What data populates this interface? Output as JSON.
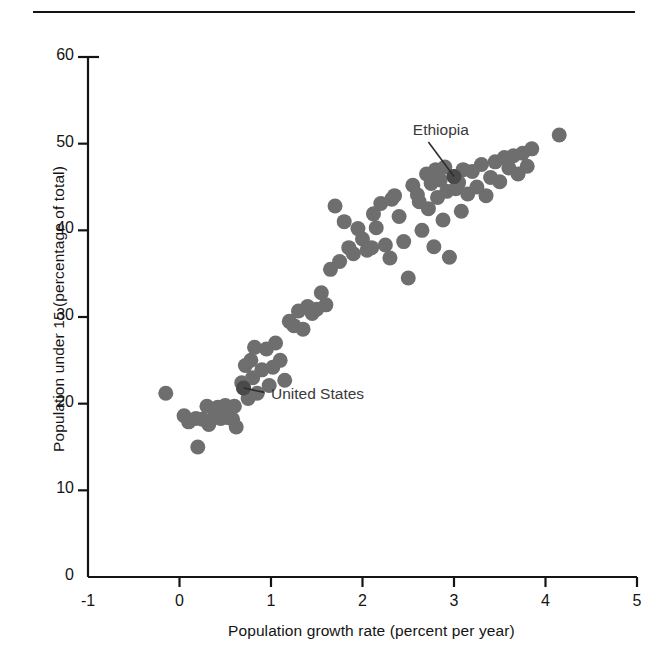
{
  "figure": {
    "has_top_rule": true,
    "background_color": "#ffffff",
    "dot_color": "#6e6e6e",
    "highlight_color": "#4a4a4a",
    "axis_color": "#141414"
  },
  "chart_data": {
    "type": "scatter",
    "title": "",
    "xlabel": "Population growth rate (percent per year)",
    "ylabel": "Population under 15 (percentage of total)",
    "xlim": [
      -1,
      5
    ],
    "ylim": [
      0,
      60
    ],
    "xticks": [
      "-1",
      "0",
      "1",
      "2",
      "3",
      "4",
      "5"
    ],
    "xtick_values": [
      -1,
      0,
      1,
      2,
      3,
      4,
      5
    ],
    "yticks": [
      "0",
      "10",
      "20",
      "30",
      "40",
      "50",
      "60"
    ],
    "ytick_values": [
      0,
      10,
      20,
      30,
      40,
      50,
      60
    ],
    "grid": false,
    "legend": "none",
    "marker_radius_px": 7.5,
    "annotations": [
      {
        "label": "Ethiopia",
        "label_x": 2.55,
        "label_y": 51.5,
        "point_x": 3.0,
        "point_y": 46.2,
        "leader_from_x": 2.72,
        "leader_from_y": 50.2,
        "highlight": true
      },
      {
        "label": "United  States",
        "label_x": 1.0,
        "label_y": 21.0,
        "point_x": 0.7,
        "point_y": 21.8,
        "leader_from_x": 0.93,
        "leader_from_y": 21.3,
        "highlight": true
      }
    ],
    "points": [
      [
        -0.15,
        21.2
      ],
      [
        0.05,
        18.6
      ],
      [
        0.1,
        17.9
      ],
      [
        0.18,
        18.3
      ],
      [
        0.2,
        15.0
      ],
      [
        0.25,
        18.2
      ],
      [
        0.3,
        19.7
      ],
      [
        0.32,
        17.6
      ],
      [
        0.38,
        18.4
      ],
      [
        0.42,
        19.6
      ],
      [
        0.45,
        18.3
      ],
      [
        0.5,
        19.8
      ],
      [
        0.52,
        18.4
      ],
      [
        0.58,
        18.2
      ],
      [
        0.6,
        19.7
      ],
      [
        0.62,
        17.3
      ],
      [
        0.68,
        22.4
      ],
      [
        0.7,
        21.8
      ],
      [
        0.72,
        24.4
      ],
      [
        0.75,
        20.6
      ],
      [
        0.78,
        25.0
      ],
      [
        0.8,
        23.0
      ],
      [
        0.82,
        26.5
      ],
      [
        0.85,
        21.2
      ],
      [
        0.9,
        23.9
      ],
      [
        0.95,
        26.3
      ],
      [
        0.98,
        22.1
      ],
      [
        1.02,
        24.2
      ],
      [
        1.05,
        27.0
      ],
      [
        1.1,
        25.0
      ],
      [
        1.15,
        22.7
      ],
      [
        1.2,
        29.5
      ],
      [
        1.25,
        29.0
      ],
      [
        1.3,
        30.7
      ],
      [
        1.35,
        28.6
      ],
      [
        1.4,
        31.2
      ],
      [
        1.45,
        30.4
      ],
      [
        1.5,
        30.9
      ],
      [
        1.55,
        32.8
      ],
      [
        1.6,
        31.4
      ],
      [
        1.65,
        35.5
      ],
      [
        1.7,
        42.8
      ],
      [
        1.75,
        36.4
      ],
      [
        1.8,
        41.0
      ],
      [
        1.85,
        38.0
      ],
      [
        1.9,
        37.3
      ],
      [
        1.95,
        40.2
      ],
      [
        2.0,
        39.0
      ],
      [
        2.05,
        37.7
      ],
      [
        2.1,
        38.0
      ],
      [
        2.12,
        41.9
      ],
      [
        2.15,
        40.3
      ],
      [
        2.2,
        43.1
      ],
      [
        2.25,
        38.3
      ],
      [
        2.3,
        36.8
      ],
      [
        2.32,
        43.6
      ],
      [
        2.35,
        44.0
      ],
      [
        2.4,
        41.6
      ],
      [
        2.45,
        38.7
      ],
      [
        2.5,
        34.5
      ],
      [
        2.55,
        45.2
      ],
      [
        2.6,
        44.1
      ],
      [
        2.62,
        43.3
      ],
      [
        2.65,
        40.0
      ],
      [
        2.7,
        46.5
      ],
      [
        2.72,
        42.5
      ],
      [
        2.75,
        45.4
      ],
      [
        2.78,
        38.1
      ],
      [
        2.8,
        47.0
      ],
      [
        2.82,
        43.8
      ],
      [
        2.85,
        45.8
      ],
      [
        2.88,
        41.2
      ],
      [
        2.9,
        47.3
      ],
      [
        2.92,
        44.5
      ],
      [
        2.95,
        36.9
      ],
      [
        3.0,
        46.2
      ],
      [
        3.02,
        44.8
      ],
      [
        3.05,
        45.5
      ],
      [
        3.08,
        42.2
      ],
      [
        3.1,
        47.0
      ],
      [
        3.15,
        44.2
      ],
      [
        3.2,
        46.8
      ],
      [
        3.25,
        45.0
      ],
      [
        3.3,
        47.6
      ],
      [
        3.35,
        44.0
      ],
      [
        3.4,
        46.1
      ],
      [
        3.45,
        47.9
      ],
      [
        3.5,
        45.6
      ],
      [
        3.55,
        48.4
      ],
      [
        3.6,
        47.2
      ],
      [
        3.65,
        48.6
      ],
      [
        3.7,
        46.5
      ],
      [
        3.75,
        48.9
      ],
      [
        3.8,
        47.4
      ],
      [
        3.85,
        49.4
      ],
      [
        4.15,
        51.0
      ]
    ]
  }
}
